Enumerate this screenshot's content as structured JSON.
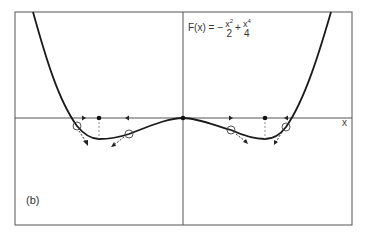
{
  "figure": {
    "panel_label": "(b)",
    "axis_label_x": "x",
    "formula": {
      "lhs": "F(x) =",
      "term1_sign": "−",
      "term1_num": "x",
      "term1_exp": "2",
      "term1_den": "2",
      "op": "+",
      "term2_num": "x",
      "term2_exp": "4",
      "term2_den": "4"
    },
    "colors": {
      "curve": "#1a1a1a",
      "axis": "#555555",
      "frame": "#555555",
      "dashed": "#777777"
    },
    "elements": {
      "fixed_points_filled": [
        "left-minimum",
        "origin",
        "right-minimum"
      ],
      "open_circles": 4,
      "flow_arrows_on_axis": 4,
      "slope_arrows": 4
    }
  }
}
